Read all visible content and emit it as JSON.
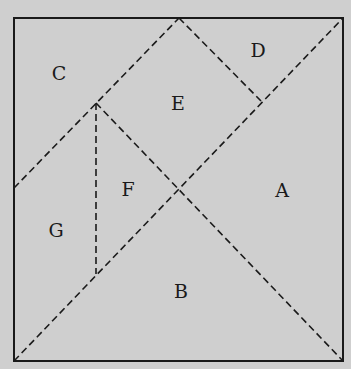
{
  "diagram": {
    "type": "tangram-square-dissection",
    "background_color": "#cfcfcf",
    "line_color": "#1a1a1a",
    "square": {
      "corners": {
        "top_left": [
          14,
          18
        ],
        "top_right": [
          343,
          18
        ],
        "bottom_right": [
          343,
          361
        ],
        "bottom_left": [
          14,
          361
        ]
      }
    },
    "dashed_lines": [
      {
        "from": [
          14,
          361
        ],
        "to": [
          343,
          18
        ],
        "description": "main diagonal bottom-left to top-right"
      },
      {
        "from": [
          14,
          188
        ],
        "to": [
          179,
          18
        ],
        "description": "left-mid to top-mid"
      },
      {
        "from": [
          179,
          18
        ],
        "to": [
          261,
          101
        ],
        "description": "top-mid to D corner"
      },
      {
        "from": [
          96,
          103
        ],
        "to": [
          343,
          361
        ],
        "description": "upper-left point to bottom-right corner"
      },
      {
        "from": [
          96,
          103
        ],
        "to": [
          96,
          274
        ],
        "description": "vertical segment"
      }
    ],
    "pieces": [
      {
        "id": "A",
        "label": "A",
        "x": 282,
        "y": 197
      },
      {
        "id": "B",
        "label": "B",
        "x": 181,
        "y": 298
      },
      {
        "id": "C",
        "label": "C",
        "x": 59,
        "y": 80
      },
      {
        "id": "D",
        "label": "D",
        "x": 258,
        "y": 57
      },
      {
        "id": "E",
        "label": "E",
        "x": 178,
        "y": 110
      },
      {
        "id": "F",
        "label": "F",
        "x": 128,
        "y": 196
      },
      {
        "id": "G",
        "label": "G",
        "x": 56,
        "y": 237
      }
    ]
  }
}
